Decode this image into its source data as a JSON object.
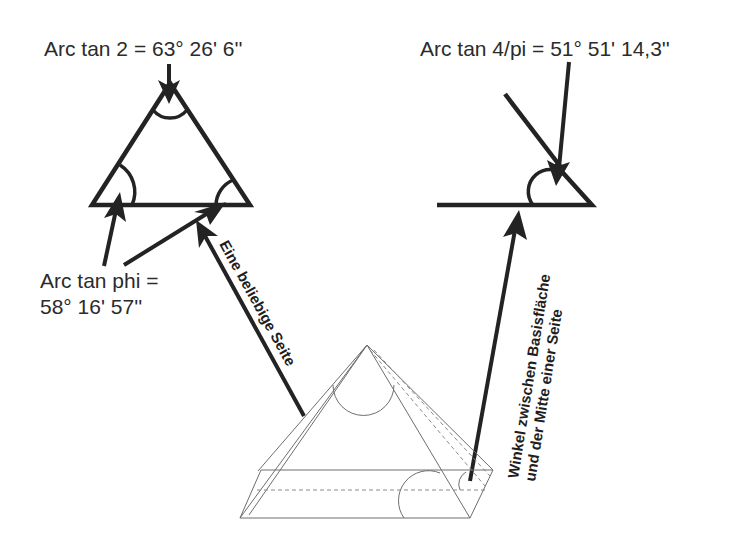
{
  "diagram": {
    "labels": {
      "apex_angle": "Arc tan 2 = 63° 26' 6''",
      "side_angle": "Arc tan 4/pi = 51° 51' 14,3''",
      "base_angles_line1": "Arc tan phi =",
      "base_angles_line2": "58° 16' 57''",
      "any_side": "Eine beliebige Seite",
      "midline_line1": "Winkel zwischen Basisfläche",
      "midline_line2": "und der Mitte einer Seite"
    },
    "colors": {
      "ink": "#232323",
      "thin_line": "#6e6e6e",
      "background": "#ffffff"
    }
  }
}
